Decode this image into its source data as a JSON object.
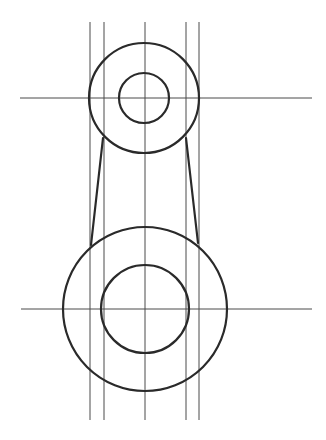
{
  "drawing": {
    "width": 326,
    "height": 440,
    "background": "#ffffff",
    "line_color": "#2a2a2a",
    "construction_color": "#4a4a4a",
    "construction_lines": {
      "vertical": [
        {
          "x": 90,
          "y1": 22,
          "y2": 420
        },
        {
          "x": 104,
          "y1": 22,
          "y2": 420
        },
        {
          "x": 145,
          "y1": 22,
          "y2": 420
        },
        {
          "x": 186,
          "y1": 22,
          "y2": 420
        },
        {
          "x": 199,
          "y1": 22,
          "y2": 420
        }
      ],
      "horizontal": [
        {
          "y": 98,
          "x1": 20,
          "x2": 312
        },
        {
          "y": 309,
          "x1": 21,
          "x2": 312
        }
      ]
    },
    "circles": [
      {
        "name": "top-outer-circle",
        "cx": 144,
        "cy": 98,
        "r": 55
      },
      {
        "name": "top-inner-circle",
        "cx": 144,
        "cy": 98,
        "r": 25
      },
      {
        "name": "bottom-outer-circle",
        "cx": 145,
        "cy": 309,
        "r": 82
      },
      {
        "name": "bottom-inner-circle",
        "cx": 145,
        "cy": 309,
        "r": 44
      }
    ],
    "tangent_lines": [
      {
        "name": "left-tangent-line",
        "x1": 103,
        "y1": 138,
        "x2": 91,
        "y2": 245
      },
      {
        "name": "right-tangent-line",
        "x1": 186,
        "y1": 138,
        "x2": 198,
        "y2": 243
      }
    ]
  }
}
